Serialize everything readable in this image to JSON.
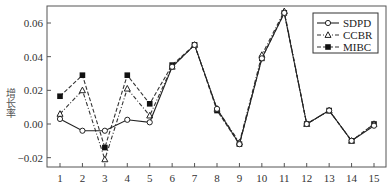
{
  "chart_data": {
    "type": "line",
    "title": "",
    "xlabel": "",
    "ylabel": "增长率",
    "x": [
      1,
      2,
      3,
      4,
      5,
      6,
      7,
      8,
      9,
      10,
      11,
      12,
      13,
      14,
      15
    ],
    "xticks": [
      "1",
      "2",
      "3",
      "4",
      "5",
      "6",
      "7",
      "8",
      "9",
      "10",
      "11",
      "12",
      "13",
      "14",
      "15"
    ],
    "yticks": [
      "−0.02",
      "0.00",
      "0.02",
      "0.04",
      "0.06"
    ],
    "ytick_values": [
      -0.02,
      0.0,
      0.02,
      0.04,
      0.06
    ],
    "ylim": [
      -0.025,
      0.07
    ],
    "xlim": [
      0.4,
      15.5
    ],
    "grid": false,
    "legend_position": "upper right",
    "series": [
      {
        "name": "SDPD",
        "marker": "open-circle",
        "line": "solid",
        "values": [
          0.003,
          -0.004,
          -0.004,
          0.0025,
          0.001,
          0.034,
          0.047,
          0.009,
          -0.012,
          0.039,
          0.066,
          0.0,
          0.008,
          -0.01,
          -0.001
        ]
      },
      {
        "name": "CCBR",
        "marker": "open-triangle",
        "line": "dash-dot",
        "values": [
          0.006,
          0.02,
          -0.021,
          0.021,
          0.005,
          0.034,
          0.047,
          0.009,
          -0.011,
          0.041,
          0.067,
          0.0,
          0.008,
          -0.01,
          0.0
        ]
      },
      {
        "name": "MIBC",
        "marker": "filled-square",
        "line": "dashed",
        "values": [
          0.0165,
          0.029,
          -0.014,
          0.029,
          0.012,
          0.035,
          0.047,
          0.008,
          -0.012,
          0.039,
          0.066,
          0.0,
          0.008,
          -0.01,
          0.0
        ]
      }
    ]
  }
}
